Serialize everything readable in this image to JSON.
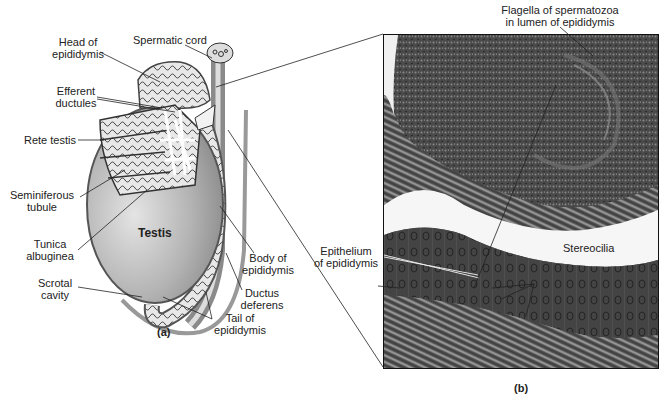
{
  "figure": {
    "panel_a": {
      "caption": "(a)",
      "organ_label": "Testis",
      "labels": {
        "head_of_epididymis": "Head of\nepididymis",
        "spermatic_cord": "Spermatic cord",
        "efferent_ductules": "Efferent\nductules",
        "rete_testis": "Rete testis",
        "seminiferous_tubule": "Seminiferous\ntubule",
        "tunica_albuginea": "Tunica\nalbuginea",
        "scrotal_cavity": "Scrotal\ncavity",
        "body_of_epididymis": "Body of\nepididymis",
        "ductus_deferens": "Ductus\ndeferens",
        "tail_of_epididymis": "Tail of\nepididymis"
      }
    },
    "panel_b": {
      "caption": "(b)",
      "labels": {
        "flagella": "Flagella of spermatozoa\nin lumen of epididymis",
        "epithelium": "Epithelium\nof epididymis",
        "stereocilia": "Stereocilia"
      }
    },
    "colors": {
      "testis_fill": "#b5b5b5",
      "tubule_fill": "#d8d8d8",
      "line": "#222222",
      "micrograph_dark": "#3d3d3d",
      "lumen": "#f4f4f4"
    }
  }
}
